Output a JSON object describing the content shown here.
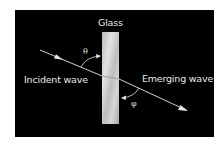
{
  "diagram": {
    "title_label": "Glass",
    "incident_label": "Incident wave",
    "emerging_label": "Emerging wave",
    "angle_incident_symbol": "θ",
    "angle_emerging_symbol": "φ",
    "colors": {
      "background": "#000000",
      "glass": "#c8c8c8",
      "ray": "#e6e6e6",
      "text": "#e8e8e8"
    }
  }
}
